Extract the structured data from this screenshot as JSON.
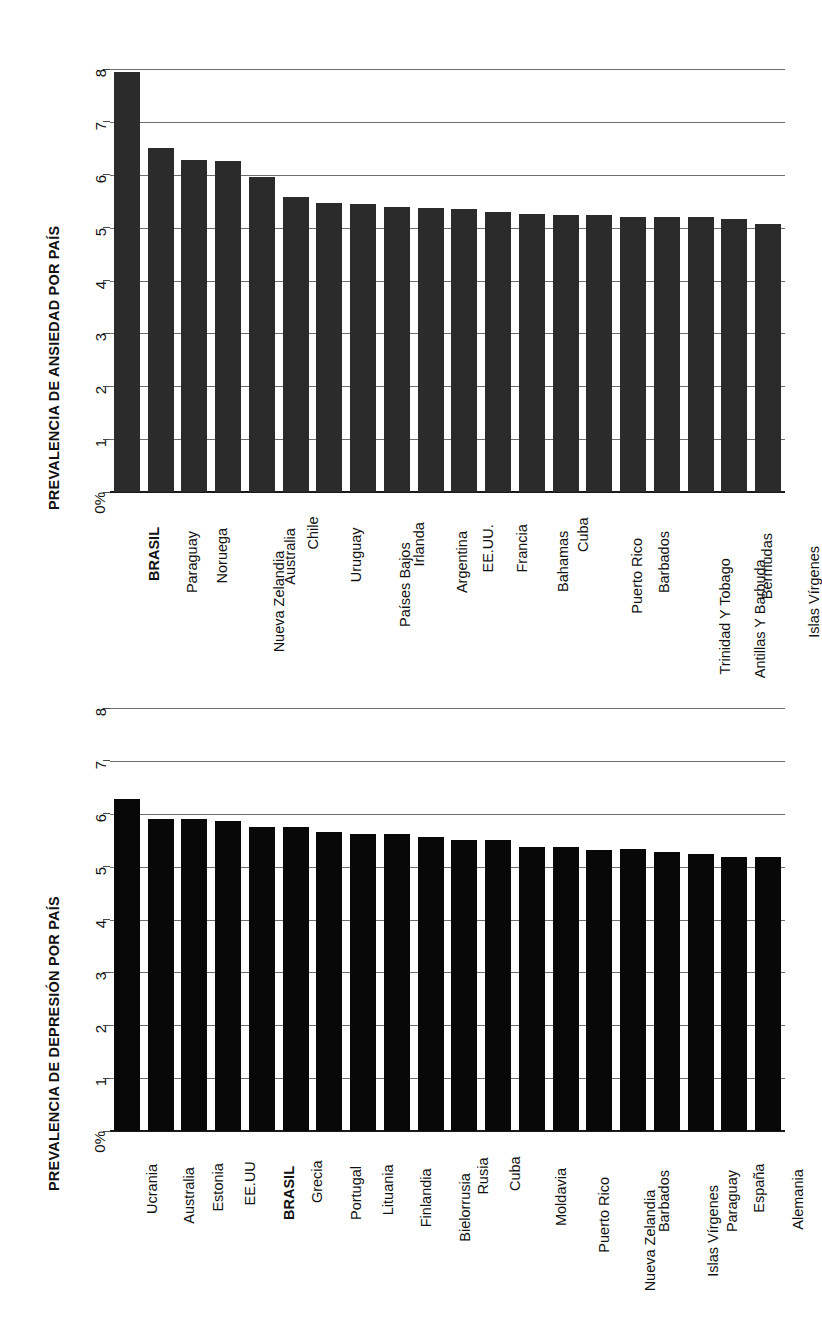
{
  "page": {
    "orientation": "rotated-90-ccw",
    "background": "#ffffff",
    "bar_color_anxiety": "#2b2b2b",
    "bar_color_depression": "#080808",
    "gridline_color": "#6e6e6e",
    "axis_color": "#1a1a1a"
  },
  "chart_data": [
    {
      "id": "anxiety",
      "type": "bar",
      "title": "PREVALENCIA DE ANSIEDAD POR PAÍS",
      "xlabel": "",
      "ylabel": "",
      "ylim": [
        0,
        8
      ],
      "yticks": [
        0,
        1,
        2,
        3,
        4,
        5,
        6,
        7,
        8
      ],
      "ytick_labels": [
        "0%",
        "1",
        "2",
        "3",
        "4",
        "5",
        "6",
        "7",
        "8"
      ],
      "grid": true,
      "legend": "none",
      "highlight": "BRASIL",
      "categories": [
        "BRASIL",
        "Paraguay",
        "Noruega",
        "Nueva Zelandia",
        "Australia",
        "Chile",
        "Uruguay",
        "Países Bajos",
        "Irlanda",
        "Argentina",
        "EE.UU.",
        "Francia",
        "Bahamas",
        "Cuba",
        "Puerto Rico",
        "Barbados",
        "Trinidad Y Tobago",
        "Antillas Y Barbuda",
        "Bermudas",
        "Islas Vírgenes"
      ],
      "values": [
        7.95,
        6.5,
        6.28,
        6.26,
        5.95,
        5.58,
        5.47,
        5.45,
        5.39,
        5.37,
        5.36,
        5.3,
        5.26,
        5.23,
        5.23,
        5.21,
        5.21,
        5.21,
        5.16,
        5.07
      ]
    },
    {
      "id": "depression",
      "type": "bar",
      "title": "PREVALENCIA DE DEPRESIÓN POR PAÍS",
      "xlabel": "",
      "ylabel": "",
      "ylim": [
        0,
        8
      ],
      "yticks": [
        0,
        1,
        2,
        3,
        4,
        5,
        6,
        7,
        8
      ],
      "ytick_labels": [
        "0%",
        "1",
        "2",
        "3",
        "4",
        "5",
        "6",
        "7",
        "8"
      ],
      "grid": true,
      "legend": "none",
      "highlight": "BRASIL",
      "categories": [
        "Ucrania",
        "Australia",
        "Estonia",
        "EE.UU",
        "BRASIL",
        "Grecia",
        "Portugal",
        "Lituania",
        "Finlandia",
        "Bielorrusia",
        "Rusia",
        "Cuba",
        "Moldavia",
        "Puerto Rico",
        "Nueva Zelandia",
        "Barbados",
        "Islas Vírgenes",
        "Paraguay",
        "España",
        "Alemania"
      ],
      "values": [
        6.27,
        5.91,
        5.91,
        5.87,
        5.75,
        5.75,
        5.66,
        5.61,
        5.61,
        5.56,
        5.5,
        5.5,
        5.37,
        5.37,
        5.32,
        5.33,
        5.28,
        5.23,
        5.19,
        5.19
      ]
    }
  ]
}
